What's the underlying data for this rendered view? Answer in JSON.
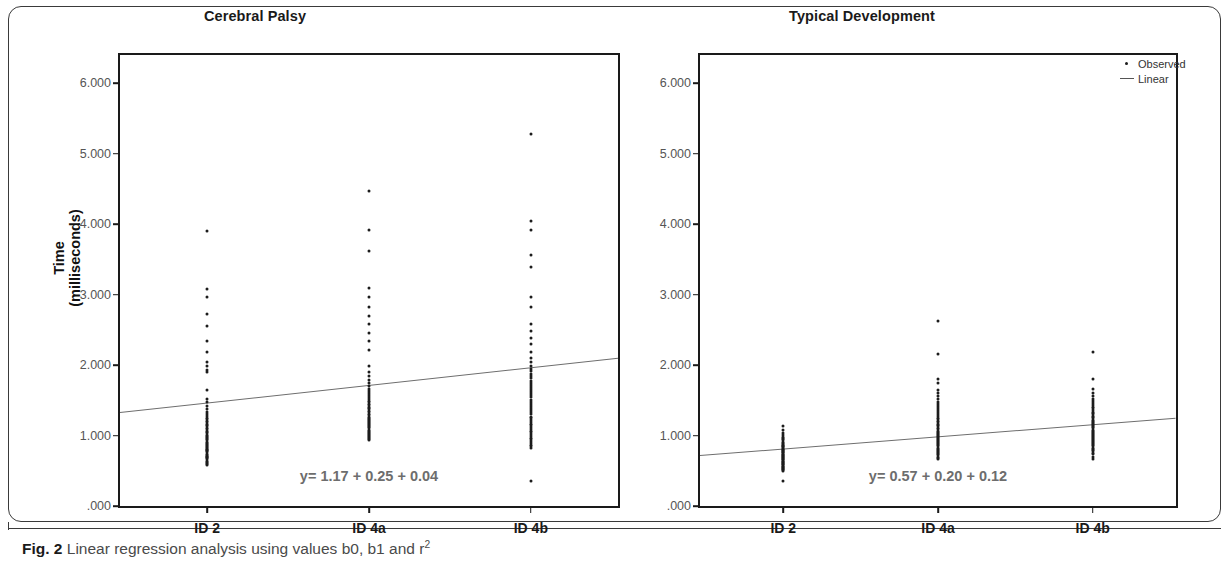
{
  "figure": {
    "caption_prefix": "Fig. 2",
    "caption_text": " Linear regression analysis using values b0, b1 and r",
    "caption_sup": "2"
  },
  "legend": {
    "position": "top-right",
    "items": [
      {
        "label": "Observed",
        "marker": "dot"
      },
      {
        "label": "Linear",
        "marker": "line"
      }
    ]
  },
  "axis": {
    "y_title_main": "Time",
    "y_title_sub": "(milliseconds)",
    "y_ticks": [
      ".000",
      "1.000",
      "2.000",
      "3.000",
      "4.000",
      "5.000",
      "6.000"
    ],
    "x_categories": [
      "ID 2",
      "ID 4a",
      "ID 4b"
    ]
  },
  "chart_data": {
    "type": "scatter",
    "title": "Linear regression analysis using values b0, b1 and r2",
    "xlabel": "",
    "ylabel": "Time (milliseconds)",
    "ylim": [
      0,
      6400
    ],
    "yticks": [
      0,
      1000,
      2000,
      3000,
      4000,
      5000,
      6000
    ],
    "ytick_labels": [
      ".000",
      "1.000",
      "2.000",
      "3.000",
      "4.000",
      "5.000",
      "6.000"
    ],
    "categories": [
      "ID 2",
      "ID 4a",
      "ID 4b"
    ],
    "grid": false,
    "legend": [
      "Observed",
      "Linear"
    ],
    "legend_position": "top-right",
    "panels": [
      {
        "name": "Cerebral Palsy",
        "title": "Cerebral Palsy",
        "annotation": "y= 1.17 + 0.25 + 0.04",
        "regression": {
          "y_start": 1330,
          "y_end": 2100
        },
        "series": [
          {
            "name": "ID 2",
            "category_index": 0,
            "values": [
              3900,
              3080,
              2960,
              2720,
              2560,
              2340,
              2180,
              2050,
              1980,
              1930,
              1900,
              1650,
              1520,
              1480,
              1420,
              1380,
              1340,
              1300,
              1280,
              1250,
              1230,
              1210,
              1190,
              1170,
              1150,
              1130,
              1110,
              1090,
              1070,
              1050,
              1030,
              1010,
              1000,
              980,
              960,
              945,
              930,
              915,
              900,
              885,
              870,
              855,
              840,
              825,
              810,
              800,
              790,
              775,
              760,
              745,
              730,
              715,
              700,
              690,
              675,
              660,
              645,
              630,
              615,
              600,
              580
            ]
          },
          {
            "name": "ID 4a",
            "category_index": 1,
            "values": [
              4470,
              3920,
              3620,
              3100,
              2960,
              2820,
              2700,
              2580,
              2460,
              2340,
              2220,
              1980,
              1900,
              1840,
              1790,
              1740,
              1700,
              1660,
              1630,
              1600,
              1570,
              1545,
              1520,
              1495,
              1470,
              1450,
              1430,
              1410,
              1390,
              1370,
              1350,
              1330,
              1310,
              1290,
              1270,
              1250,
              1235,
              1220,
              1205,
              1190,
              1175,
              1160,
              1145,
              1130,
              1115,
              1100,
              1085,
              1070,
              1055,
              1040,
              1025,
              1010,
              1000,
              985,
              970,
              955,
              940
            ]
          },
          {
            "name": "ID 4b",
            "category_index": 2,
            "values": [
              5280,
              4040,
              3920,
              3560,
              3390,
              2960,
              2820,
              2580,
              2480,
              2390,
              2300,
              2180,
              2100,
              2040,
              1990,
              1950,
              1910,
              1870,
              1840,
              1810,
              1780,
              1750,
              1720,
              1690,
              1660,
              1630,
              1600,
              1570,
              1540,
              1510,
              1480,
              1450,
              1420,
              1390,
              1360,
              1330,
              1300,
              1270,
              1245,
              1220,
              1195,
              1170,
              1145,
              1120,
              1095,
              1070,
              1045,
              1020,
              995,
              970,
              945,
              920,
              895,
              870,
              845,
              820,
              350
            ]
          }
        ]
      },
      {
        "name": "Typical Development",
        "title": "Typical Development",
        "annotation": "y= 0.57 + 0.20 + 0.12",
        "regression": {
          "y_start": 720,
          "y_end": 1250
        },
        "series": [
          {
            "name": "ID 2",
            "category_index": 0,
            "values": [
              1130,
              1080,
              1040,
              1010,
              985,
              965,
              945,
              930,
              915,
              900,
              885,
              870,
              858,
              846,
              834,
              822,
              810,
              800,
              790,
              780,
              770,
              760,
              750,
              740,
              730,
              720,
              710,
              700,
              690,
              680,
              670,
              660,
              650,
              640,
              630,
              620,
              610,
              600,
              590,
              580,
              570,
              560,
              550,
              540,
              530,
              520,
              505,
              490,
              360
            ]
          },
          {
            "name": "ID 4a",
            "category_index": 1,
            "values": [
              2620,
              2160,
              1800,
              1740,
              1650,
              1600,
              1560,
              1520,
              1480,
              1450,
              1420,
              1390,
              1360,
              1330,
              1305,
              1280,
              1255,
              1230,
              1210,
              1190,
              1170,
              1150,
              1130,
              1110,
              1090,
              1070,
              1055,
              1040,
              1025,
              1010,
              995,
              980,
              965,
              950,
              935,
              920,
              905,
              890,
              875,
              860,
              845,
              830,
              815,
              800,
              785,
              770,
              755,
              740,
              720,
              700,
              680,
              660
            ]
          },
          {
            "name": "ID 4b",
            "category_index": 2,
            "values": [
              2180,
              1800,
              1660,
              1600,
              1560,
              1520,
              1490,
              1460,
              1435,
              1410,
              1385,
              1360,
              1340,
              1320,
              1300,
              1280,
              1262,
              1244,
              1226,
              1210,
              1194,
              1178,
              1162,
              1146,
              1130,
              1115,
              1100,
              1085,
              1070,
              1055,
              1040,
              1025,
              1010,
              995,
              980,
              965,
              950,
              935,
              920,
              905,
              890,
              875,
              860,
              845,
              830,
              815,
              795,
              775,
              755,
              735,
              700,
              660
            ]
          }
        ]
      }
    ]
  }
}
